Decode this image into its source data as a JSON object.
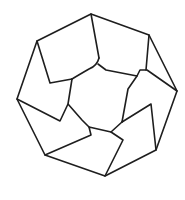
{
  "diagram": {
    "title": "",
    "stroke_color": "#1e1e1e",
    "background": "#ffffff",
    "outer_octagon": "91,14 149,35 177,91 156,150 105,176 45,155 17,99 37,41",
    "lines": [
      "91,14 99,58",
      "37,41 50,83 72,79",
      "149,35 146,70",
      "98,64 106,70 137,76 140,70 147,70 177,91",
      "137,76 128,89 122,122",
      "122,122 151,104 156,150",
      "122,122 111,132 123,140 105,176",
      "111,132 89,127 91,135 45,155",
      "72,79 68,104 60,121 17,99",
      "68,104 82,120 89,127"
    ],
    "curve": "M99,58 Q97,66 89,69 Q82,73 72,79"
  }
}
